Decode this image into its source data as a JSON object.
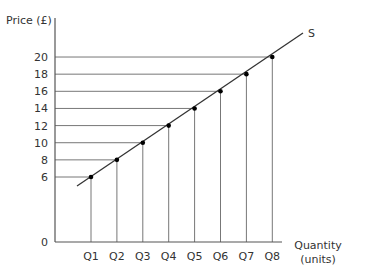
{
  "chart_data": {
    "type": "line",
    "title": "",
    "xlabel": "Quantity (units)",
    "xlabel_lines": [
      "Quantity",
      "(units)"
    ],
    "ylabel": "Price (£)",
    "origin_label": "0",
    "categories": [
      "Q1",
      "Q2",
      "Q3",
      "Q4",
      "Q5",
      "Q6",
      "Q7",
      "Q8"
    ],
    "series": [
      {
        "name": "S",
        "values": [
          6,
          8,
          10,
          12,
          14,
          16,
          18,
          20
        ]
      }
    ],
    "y_ticks": [
      6,
      8,
      10,
      12,
      14,
      16,
      18,
      20
    ],
    "series_label": "S",
    "ylim": [
      0,
      20
    ],
    "grid": false,
    "annotations": "Dashed-style guide lines from each point to both axes"
  },
  "colors": {
    "axis": "#555555",
    "guide": "#777777",
    "line": "#333333",
    "point": "#000000"
  }
}
